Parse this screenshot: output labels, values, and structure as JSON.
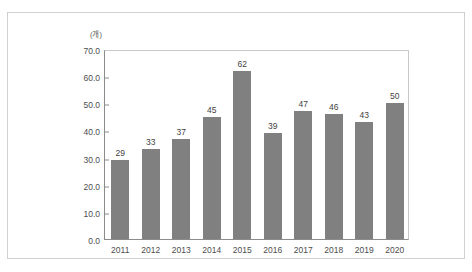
{
  "chart_data": {
    "type": "bar",
    "title": "",
    "subtitle": "",
    "xlabel": "",
    "ylabel": "",
    "unit_label": "(개)",
    "categories": [
      "2011",
      "2012",
      "2013",
      "2014",
      "2015",
      "2016",
      "2017",
      "2018",
      "2019",
      "2020"
    ],
    "values": [
      29,
      33,
      37,
      45,
      62,
      39,
      47,
      46,
      43,
      50
    ],
    "data_labels": [
      "29",
      "33",
      "37",
      "45",
      "62",
      "39",
      "47",
      "46",
      "43",
      "50"
    ],
    "ylim": [
      0,
      70
    ],
    "ytick_step": 10,
    "ytick_labels": [
      "70.0",
      "60.0",
      "50.0",
      "40.0",
      "30.0",
      "20.0",
      "10.0",
      "0.0"
    ],
    "ytick_values": [
      70,
      60,
      50,
      40,
      30,
      20,
      10,
      0
    ],
    "grid": false,
    "legend": null,
    "legend_position": "none",
    "series": [
      {
        "name": "",
        "values": [
          29,
          33,
          37,
          45,
          62,
          39,
          47,
          46,
          43,
          50
        ]
      }
    ],
    "colors": {
      "bar": "#808080",
      "axis": "#8c8c8c",
      "plot_border": "#c8c8c8",
      "frame": "#d0d0d0",
      "text": "#4d4d4d",
      "background": "#ffffff"
    }
  }
}
